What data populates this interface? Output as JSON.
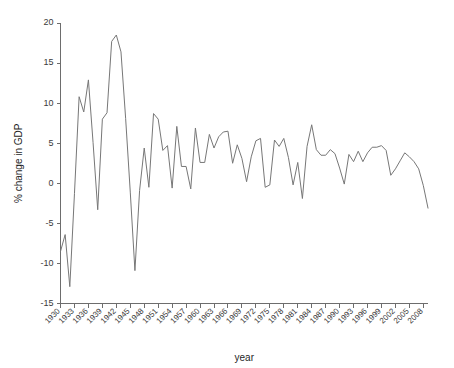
{
  "chart_data": {
    "type": "line",
    "title": "",
    "xlabel": "year",
    "ylabel": "% change in GDP",
    "xlim": [
      1930,
      2009
    ],
    "ylim": [
      -15,
      20
    ],
    "yticks": [
      -15,
      -10,
      -5,
      0,
      5,
      10,
      15,
      20
    ],
    "ytick_labels": [
      "-15",
      "-10",
      "-5",
      "0",
      "5",
      "10",
      "15",
      "20"
    ],
    "xticks": [
      1930,
      1933,
      1936,
      1939,
      1942,
      1945,
      1948,
      1951,
      1954,
      1957,
      1960,
      1963,
      1966,
      1969,
      1972,
      1975,
      1978,
      1981,
      1984,
      1987,
      1990,
      1993,
      1996,
      1999,
      2002,
      2005,
      2008
    ],
    "xtick_labels": [
      "1930",
      "1933",
      "1936",
      "1939",
      "1942",
      "1945",
      "1948",
      "1951",
      "1954",
      "1957",
      "1960",
      "1963",
      "1966",
      "1969",
      "1972",
      "1975",
      "1978",
      "1981",
      "1984",
      "1987",
      "1990",
      "1993",
      "1996",
      "1999",
      "2002",
      "2005",
      "2008"
    ],
    "grid": false,
    "legend": false,
    "line_color": "#777777",
    "axis_color": "#6d6d6d",
    "background": "#ffffff",
    "x": [
      1930,
      1931,
      1932,
      1933,
      1934,
      1935,
      1936,
      1937,
      1938,
      1939,
      1940,
      1941,
      1942,
      1943,
      1944,
      1945,
      1946,
      1947,
      1948,
      1949,
      1950,
      1951,
      1952,
      1953,
      1954,
      1955,
      1956,
      1957,
      1958,
      1959,
      1960,
      1961,
      1962,
      1963,
      1964,
      1965,
      1966,
      1967,
      1968,
      1969,
      1970,
      1971,
      1972,
      1973,
      1974,
      1975,
      1976,
      1977,
      1978,
      1979,
      1980,
      1981,
      1982,
      1983,
      1984,
      1985,
      1986,
      1987,
      1988,
      1989,
      1990,
      1991,
      1992,
      1993,
      1994,
      1995,
      1996,
      1997,
      1998,
      1999,
      2000,
      2001,
      2002,
      2003,
      2004,
      2005,
      2006,
      2007,
      2008,
      2009
    ],
    "y": [
      -8.5,
      -6.4,
      -12.9,
      -1.3,
      10.8,
      8.9,
      12.9,
      5.1,
      -3.3,
      8.0,
      8.8,
      17.7,
      18.5,
      16.4,
      8.1,
      -1.1,
      -10.9,
      -0.9,
      4.4,
      -0.5,
      8.7,
      8.0,
      4.1,
      4.7,
      -0.6,
      7.1,
      2.1,
      2.1,
      -0.7,
      6.9,
      2.6,
      2.6,
      6.1,
      4.4,
      5.8,
      6.4,
      6.5,
      2.5,
      4.8,
      3.1,
      0.2,
      3.3,
      5.3,
      5.6,
      -0.5,
      -0.2,
      5.4,
      4.6,
      5.6,
      3.2,
      -0.2,
      2.6,
      -1.9,
      4.6,
      7.3,
      4.2,
      3.5,
      3.5,
      4.2,
      3.7,
      1.9,
      -0.1,
      3.6,
      2.7,
      4.0,
      2.7,
      3.8,
      4.5,
      4.5,
      4.7,
      4.1,
      1.0,
      1.8,
      2.8,
      3.8,
      3.3,
      2.7,
      1.8,
      -0.3,
      -3.1
    ]
  }
}
